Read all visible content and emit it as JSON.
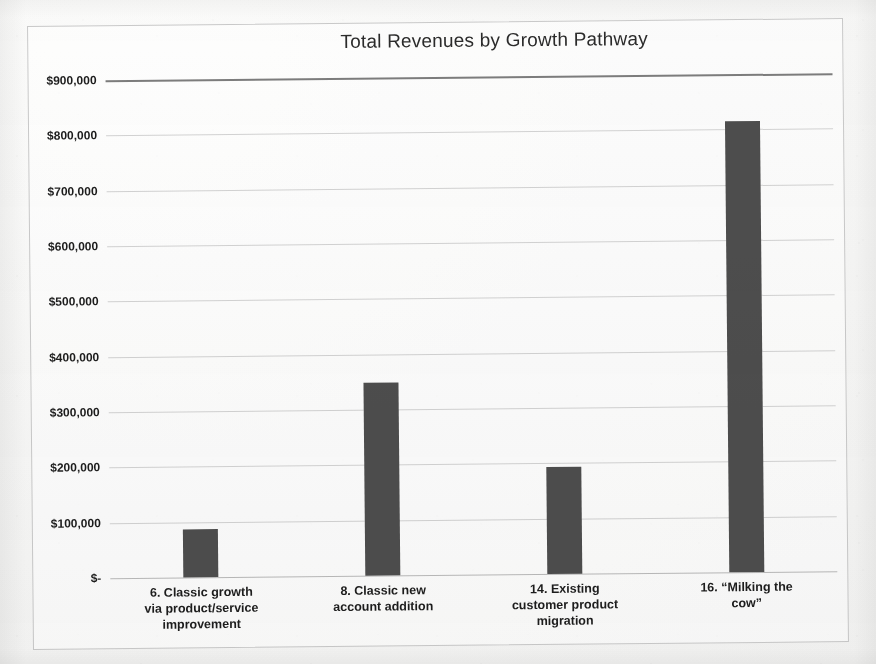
{
  "chart_data": {
    "type": "bar",
    "title": "Total Revenues by Growth Pathway",
    "xlabel": "",
    "ylabel": "",
    "categories": [
      "6. Classic growth via product/service improvement",
      "8. Classic new account addition",
      "14. Existing customer product migration",
      "16. “Milking the cow”"
    ],
    "category_lines": [
      [
        "6. Classic growth",
        "via product/service",
        "improvement"
      ],
      [
        "8. Classic new",
        "account addition"
      ],
      [
        "14. Existing",
        "customer product",
        "migration"
      ],
      [
        "16. “Milking the",
        "cow”"
      ]
    ],
    "values": [
      87000,
      349000,
      193000,
      815000
    ],
    "ylim": [
      0,
      900000
    ],
    "ytick_values": [
      0,
      100000,
      200000,
      300000,
      400000,
      500000,
      600000,
      700000,
      800000,
      900000
    ],
    "ytick_labels": [
      "$-",
      "$100,000",
      "$200,000",
      "$300,000",
      "$400,000",
      "$500,000",
      "$600,000",
      "$700,000",
      "$800,000",
      "$900,000"
    ],
    "grid": true,
    "legend": false,
    "bar_color": "#4d4d4d",
    "gridline_color": "#d2d2d2",
    "background_color": "#f7f7f6"
  }
}
